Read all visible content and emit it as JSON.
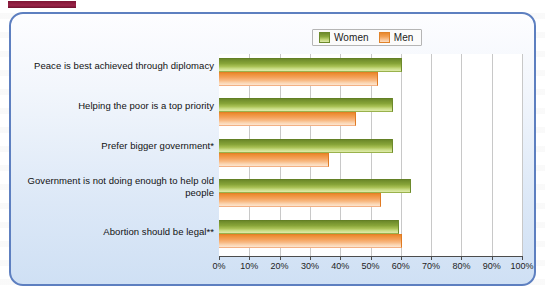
{
  "panel": {
    "corner_tab_color": "#8a1e40",
    "border_color": "#5d7fc0"
  },
  "legend": {
    "position": "top-right",
    "entries": [
      {
        "label": "Women",
        "color": "#8aa83d",
        "icon": "legend-swatch-women"
      },
      {
        "label": "Men",
        "color": "#f2a055",
        "icon": "legend-swatch-men"
      }
    ]
  },
  "chart_data": {
    "type": "bar",
    "orientation": "horizontal",
    "title": "",
    "subtitle": "",
    "xlabel": "",
    "ylabel": "",
    "xlim": [
      0,
      100
    ],
    "grid": true,
    "legend_position": "top-right",
    "categories": [
      "Peace is best achieved through diplomacy",
      "Helping the poor is a top priority",
      "Prefer bigger government*",
      "Government is not doing enough to help old people",
      "Abortion should be legal**"
    ],
    "tick_labels": [
      "0%",
      "10%",
      "20%",
      "30%",
      "40%",
      "50%",
      "60%",
      "70%",
      "80%",
      "90%",
      "100%"
    ],
    "tick_values": [
      0,
      10,
      20,
      30,
      40,
      50,
      60,
      70,
      80,
      90,
      100
    ],
    "series": [
      {
        "name": "Women",
        "color": "#8aa83d",
        "values": [
          60,
          57,
          57,
          63,
          59
        ]
      },
      {
        "name": "Men",
        "color": "#f2a055",
        "values": [
          52,
          45,
          36,
          53,
          60
        ]
      }
    ]
  }
}
